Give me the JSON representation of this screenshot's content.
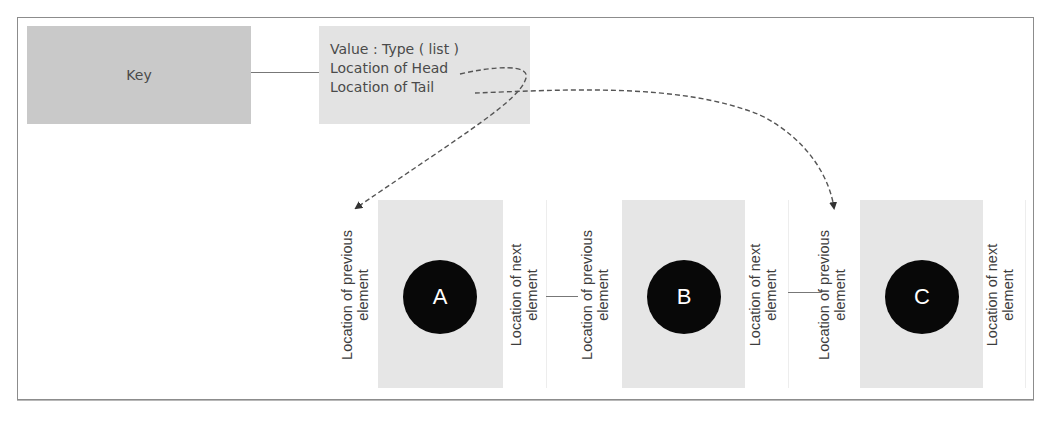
{
  "diagram": {
    "key_box": {
      "label": "Key"
    },
    "value_box": {
      "lines": [
        "Value : Type ( list )",
        "Location of Head",
        "Location of Tail"
      ]
    },
    "nodes": [
      {
        "label": "A",
        "prev_label": "Location of previous element",
        "next_label": "Location of next element"
      },
      {
        "label": "B",
        "prev_label": "Location of previous element",
        "next_label": "Location of next element"
      },
      {
        "label": "C",
        "prev_label": "Location of previous element",
        "next_label": "Location of next element"
      }
    ],
    "pointers": [
      {
        "from": "Location of Head",
        "to": "A",
        "style": "dashed-arrow"
      },
      {
        "from": "Location of Tail",
        "to": "C",
        "style": "dashed-arrow"
      }
    ],
    "links": [
      {
        "from": "Key",
        "to": "Value"
      },
      {
        "from": "A",
        "to": "B"
      },
      {
        "from": "B",
        "to": "C"
      }
    ],
    "colors": {
      "key_fill": "#c9c9c9",
      "value_fill": "#e3e3e3",
      "node_fill": "#e6e6e6",
      "circle_fill": "#080808",
      "line": "#555555"
    }
  }
}
